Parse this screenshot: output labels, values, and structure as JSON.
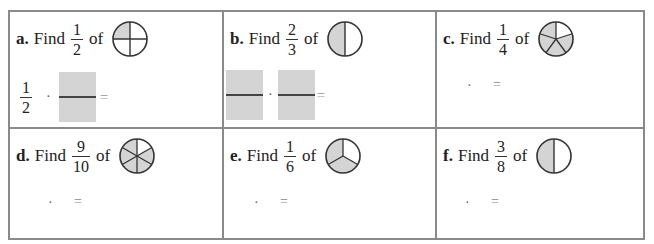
{
  "worksheet": {
    "problems": [
      {
        "letter": "a.",
        "find": "Find",
        "num": "1",
        "den": "2",
        "of": "of",
        "circle": {
          "parts": 4,
          "shaded": 1,
          "type": "quarters"
        },
        "work": {
          "given_num": "1",
          "given_den": "2",
          "dot": "·",
          "eq": "="
        }
      },
      {
        "letter": "b.",
        "find": "Find",
        "num": "2",
        "den": "3",
        "of": "of",
        "circle": {
          "parts": 2,
          "shaded": 1,
          "type": "halves"
        },
        "work": {
          "dot": "·",
          "eq": "="
        }
      },
      {
        "letter": "c.",
        "find": "Find",
        "num": "1",
        "den": "4",
        "of": "of",
        "circle": {
          "parts": 5,
          "shaded": 4,
          "type": "fifths"
        },
        "work": {
          "dot": "·",
          "eq": "="
        }
      },
      {
        "letter": "d.",
        "find": "Find",
        "num": "9",
        "den": "10",
        "of": "of",
        "circle": {
          "parts": 6,
          "shaded": 5,
          "type": "sixths"
        },
        "work": {
          "dot": "·",
          "eq": "="
        }
      },
      {
        "letter": "e.",
        "find": "Find",
        "num": "1",
        "den": "6",
        "of": "of",
        "circle": {
          "parts": 3,
          "shaded": 2,
          "type": "thirds"
        },
        "work": {
          "dot": "·",
          "eq": "="
        }
      },
      {
        "letter": "f.",
        "find": "Find",
        "num": "3",
        "den": "8",
        "of": "of",
        "circle": {
          "parts": 2,
          "shaded": 1,
          "type": "halves"
        },
        "work": {
          "dot": "·",
          "eq": "="
        }
      }
    ],
    "colors": {
      "border": "#8a8a8a",
      "shade": "#d4d4d4",
      "stroke": "#333333"
    }
  }
}
